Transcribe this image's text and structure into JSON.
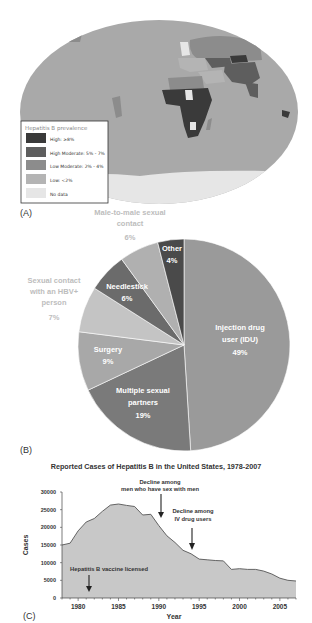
{
  "panels": {
    "a": {
      "label": "(A)"
    },
    "b": {
      "label": "(B)"
    },
    "c": {
      "label": "(C)"
    }
  },
  "map": {
    "legend": {
      "title": "Hepatitis B prevalence",
      "items": [
        {
          "label": "High: ≥8%",
          "color": "#3a3a3a"
        },
        {
          "label": "High Moderate: 5% - 7%",
          "color": "#5e5e5e"
        },
        {
          "label": "Low Moderate: 2% - 4%",
          "color": "#8c8c8c"
        },
        {
          "label": "Low: <2%",
          "color": "#b4b4b4"
        },
        {
          "label": "No data",
          "color": "#e6e6e6"
        }
      ]
    },
    "colors": {
      "ocean": "#ffffff",
      "land_default": "#a9a9a9",
      "antarctica": "#e6e6e6"
    }
  },
  "chart_data": [
    {
      "type": "pie",
      "title": "",
      "slices": [
        {
          "label": "Injection drug user (IDU)",
          "value": 49,
          "color": "#9a9a9a",
          "text_color": "#ffffff"
        },
        {
          "label": "Multiple sexual partners",
          "value": 19,
          "color": "#7a7a7a",
          "text_color": "#ffffff"
        },
        {
          "label": "Surgery",
          "value": 9,
          "color": "#a8a8a8",
          "text_color": "#ffffff"
        },
        {
          "label": "Sexual contact with an HBV+ person",
          "value": 7,
          "color": "#c4c4c4",
          "text_color": "#bdbdbd"
        },
        {
          "label": "Needlestick",
          "value": 6,
          "color": "#6b6b6b",
          "text_color": "#ffffff"
        },
        {
          "label": "Male-to-male sexual contact",
          "value": 6,
          "color": "#b0b0b0",
          "text_color": "#bdbdbd"
        },
        {
          "label": "Other",
          "value": 4,
          "color": "#4a4a4a",
          "text_color": "#ffffff"
        }
      ],
      "labels_text": {
        "idu": [
          "Injection drug",
          "user (IDU)",
          "49%"
        ],
        "multiple": [
          "Multiple sexual",
          "partners",
          "19%"
        ],
        "surgery": [
          "Surgery",
          "9%"
        ],
        "hbv": [
          "Sexual contact",
          "with an HBV+",
          "person",
          "7%"
        ],
        "needle": [
          "Needlestick",
          "6%"
        ],
        "msm": [
          "Male-to-male sexual",
          "contact",
          "6%"
        ],
        "other": [
          "Other",
          "4%"
        ]
      }
    },
    {
      "type": "area",
      "title": "Reported Cases of Hepatitis B in the United States, 1978-2007",
      "xlabel": "Year",
      "ylabel": "Cases",
      "ylim": [
        0,
        30000
      ],
      "xlim": [
        1978,
        2007
      ],
      "yticks": [
        0,
        5000,
        10000,
        15000,
        20000,
        25000,
        30000
      ],
      "xticks": [
        1980,
        1985,
        1990,
        1995,
        2000,
        2005
      ],
      "x": [
        1978,
        1979,
        1980,
        1981,
        1982,
        1983,
        1984,
        1985,
        1986,
        1987,
        1988,
        1989,
        1990,
        1991,
        1992,
        1993,
        1994,
        1995,
        1996,
        1997,
        1998,
        1999,
        2000,
        2001,
        2002,
        2003,
        2004,
        2005,
        2006,
        2007
      ],
      "values": [
        15000,
        15500,
        19000,
        21500,
        22500,
        24500,
        26300,
        26600,
        26200,
        25900,
        23500,
        23700,
        20500,
        17600,
        15700,
        13500,
        12500,
        11000,
        10800,
        10600,
        10500,
        8100,
        8300,
        8100,
        8100,
        7600,
        6800,
        5600,
        5000,
        4800
      ],
      "fill_color": "#c8c8c8",
      "line_color": "#555555",
      "annotations": [
        {
          "lines": [
            "Decline among",
            "men who have sex with men"
          ],
          "year": 1990
        },
        {
          "lines": [
            "Decline among",
            "IV drug users"
          ],
          "year": 1994.3
        },
        {
          "lines": [
            "Hepatitis B vaccine licensed"
          ],
          "year": 1981.5
        }
      ]
    }
  ]
}
